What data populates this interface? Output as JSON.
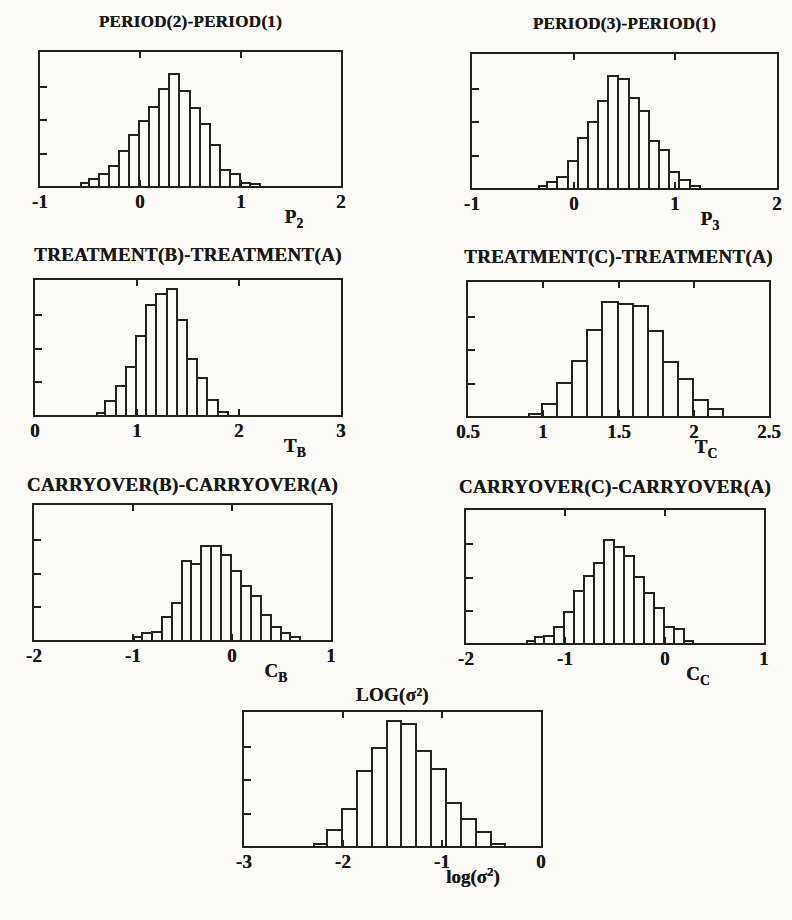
{
  "figure": {
    "background_color": "#fcfbf7",
    "ink_color": "#23211d"
  },
  "chart_data": [
    {
      "id": "p2",
      "type": "bar",
      "title": "PERIOD(2)-PERIOD(1)",
      "xlabel": {
        "pre": "P",
        "sub": "2",
        "sup": "",
        "post": ""
      },
      "ylabel": "",
      "xlim": [
        -1,
        2
      ],
      "ylim": [
        0,
        1
      ],
      "grid": false,
      "legend": null,
      "xticks": [
        "-1",
        "0",
        "1",
        "2"
      ],
      "xtick_values": [
        -1,
        0,
        1,
        2
      ],
      "ytick_labels": [],
      "bin_start": -0.6,
      "bin_width": 0.1,
      "values": [
        0.03,
        0.06,
        0.1,
        0.16,
        0.27,
        0.39,
        0.49,
        0.6,
        0.73,
        0.84,
        0.72,
        0.59,
        0.47,
        0.31,
        0.13,
        0.1,
        0.03,
        0.02
      ]
    },
    {
      "id": "p3",
      "type": "bar",
      "title": "PERIOD(3)-PERIOD(1)",
      "xlabel": {
        "pre": "P",
        "sub": "3",
        "sup": "",
        "post": ""
      },
      "ylabel": "",
      "xlim": [
        -1,
        2
      ],
      "ylim": [
        0,
        1
      ],
      "grid": false,
      "legend": null,
      "xticks": [
        "-1",
        "0",
        "1",
        "2"
      ],
      "xtick_values": [
        -1,
        0,
        1,
        2
      ],
      "ytick_labels": [],
      "bin_start": -0.35,
      "bin_width": 0.1,
      "values": [
        0.02,
        0.05,
        0.09,
        0.21,
        0.38,
        0.5,
        0.66,
        0.84,
        0.82,
        0.68,
        0.58,
        0.36,
        0.29,
        0.13,
        0.07,
        0.02
      ]
    },
    {
      "id": "tb",
      "type": "bar",
      "title": "TREATMENT(B)-TREATMENT(A)",
      "xlabel": {
        "pre": "T",
        "sub": "B",
        "sup": "",
        "post": ""
      },
      "ylabel": "",
      "xlim": [
        0,
        3
      ],
      "ylim": [
        0,
        1
      ],
      "grid": false,
      "legend": null,
      "xticks": [
        "0",
        "1",
        "2",
        "3"
      ],
      "xtick_values": [
        0,
        1,
        2,
        3
      ],
      "ytick_labels": [],
      "bin_start": 0.6,
      "bin_width": 0.1,
      "values": [
        0.02,
        0.11,
        0.22,
        0.36,
        0.59,
        0.82,
        0.9,
        0.94,
        0.71,
        0.42,
        0.28,
        0.12,
        0.03
      ]
    },
    {
      "id": "tc",
      "type": "bar",
      "title": "TREATMENT(C)-TREATMENT(A)",
      "xlabel": {
        "pre": "T",
        "sub": "C",
        "sup": "",
        "post": ""
      },
      "ylabel": "",
      "xlim": [
        0.5,
        2.5
      ],
      "ylim": [
        0,
        1
      ],
      "grid": false,
      "legend": null,
      "xticks": [
        "0.5",
        "1",
        "1.5",
        "2",
        "2.5"
      ],
      "xtick_values": [
        0.5,
        1,
        1.5,
        2,
        2.5
      ],
      "ytick_labels": [],
      "bin_start": 0.9,
      "bin_width": 0.1,
      "values": [
        0.02,
        0.1,
        0.25,
        0.42,
        0.65,
        0.86,
        0.84,
        0.83,
        0.64,
        0.41,
        0.28,
        0.13,
        0.06
      ]
    },
    {
      "id": "cb",
      "type": "bar",
      "title": "CARRYOVER(B)-CARRYOVER(A)",
      "xlabel": {
        "pre": "C",
        "sub": "B",
        "sup": "",
        "post": ""
      },
      "ylabel": "",
      "xlim": [
        -2,
        1
      ],
      "ylim": [
        0,
        1
      ],
      "grid": false,
      "legend": null,
      "xticks": [
        "-2",
        "-1",
        "0",
        "1"
      ],
      "xtick_values": [
        -2,
        -1,
        0,
        1
      ],
      "ytick_labels": [],
      "bin_start": -1.0,
      "bin_width": 0.1,
      "values": [
        0.03,
        0.06,
        0.07,
        0.18,
        0.28,
        0.59,
        0.57,
        0.7,
        0.7,
        0.64,
        0.52,
        0.41,
        0.33,
        0.19,
        0.1,
        0.06,
        0.03
      ]
    },
    {
      "id": "cc",
      "type": "bar",
      "title": "CARRYOVER(C)-CARRYOVER(A)",
      "xlabel": {
        "pre": "C",
        "sub": "C",
        "sup": "",
        "post": ""
      },
      "ylabel": "",
      "xlim": [
        -2,
        1
      ],
      "ylim": [
        0,
        1
      ],
      "grid": false,
      "legend": null,
      "xticks": [
        "-2",
        "-1",
        "0",
        "1"
      ],
      "xtick_values": [
        -2,
        -1,
        0,
        1
      ],
      "ytick_labels": [],
      "bin_start": -1.4,
      "bin_width": 0.1,
      "values": [
        0.02,
        0.05,
        0.06,
        0.13,
        0.24,
        0.4,
        0.51,
        0.61,
        0.78,
        0.73,
        0.66,
        0.5,
        0.38,
        0.27,
        0.13,
        0.11,
        0.02
      ]
    },
    {
      "id": "log",
      "type": "bar",
      "title": "LOG(σ²)",
      "xlabel": {
        "pre": "log(σ",
        "sub": "",
        "sup": "2",
        "post": ")"
      },
      "ylabel": "",
      "xlim": [
        -3,
        0
      ],
      "ylim": [
        0,
        1
      ],
      "grid": false,
      "legend": null,
      "xticks": [
        "-3",
        "-2",
        "-1",
        "0"
      ],
      "xtick_values": [
        -3,
        -2,
        -1,
        0
      ],
      "ytick_labels": [],
      "bin_start": -2.3,
      "bin_width": 0.15,
      "values": [
        0.02,
        0.13,
        0.28,
        0.57,
        0.74,
        0.94,
        0.92,
        0.72,
        0.58,
        0.33,
        0.21,
        0.11,
        0.02
      ]
    }
  ]
}
